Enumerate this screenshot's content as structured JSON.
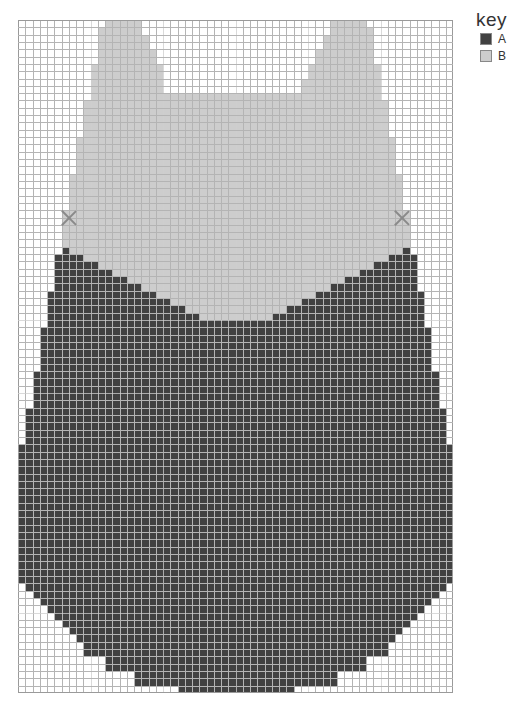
{
  "legend": {
    "title": "key",
    "items": [
      {
        "label": "A",
        "color": "#414141"
      },
      {
        "label": "B",
        "color": "#cdcdcd"
      }
    ]
  },
  "grid": {
    "cols": 60,
    "rows": 92,
    "major_every": 10,
    "major_cols": [
      10,
      20,
      30,
      40,
      50
    ],
    "major_rows": [
      41,
      51,
      61,
      71,
      81
    ],
    "line_color": "#b4b4b4",
    "background": "#ffffff"
  },
  "marks": [
    {
      "name": "left-marker",
      "col": 7,
      "row": 27
    },
    {
      "name": "right-marker",
      "col": 53,
      "row": 27
    }
  ],
  "pattern": {
    "B": [
      {
        "rows": [
          0,
          0
        ],
        "spans": [
          [
            12,
            16
          ],
          [
            43,
            47
          ]
        ]
      },
      {
        "rows": [
          1,
          1
        ],
        "spans": [
          [
            11,
            16
          ],
          [
            43,
            48
          ]
        ]
      },
      {
        "rows": [
          2,
          3
        ],
        "spans": [
          [
            11,
            17
          ],
          [
            42,
            48
          ]
        ]
      },
      {
        "rows": [
          4,
          5
        ],
        "spans": [
          [
            11,
            18
          ],
          [
            41,
            48
          ]
        ]
      },
      {
        "rows": [
          6,
          7
        ],
        "spans": [
          [
            10,
            19
          ],
          [
            40,
            49
          ]
        ]
      },
      {
        "rows": [
          8,
          9
        ],
        "spans": [
          [
            10,
            19
          ],
          [
            39,
            49
          ]
        ]
      },
      {
        "rows": [
          10,
          10
        ],
        "spans": [
          [
            10,
            49
          ]
        ]
      },
      {
        "rows": [
          11,
          15
        ],
        "spans": [
          [
            9,
            50
          ]
        ]
      },
      {
        "rows": [
          16,
          20
        ],
        "spans": [
          [
            8,
            51
          ]
        ]
      },
      {
        "rows": [
          21,
          25
        ],
        "spans": [
          [
            7,
            52
          ]
        ]
      },
      {
        "rows": [
          26,
          30
        ],
        "spans": [
          [
            6,
            53
          ]
        ]
      },
      {
        "rows": [
          31,
          31
        ],
        "spans": [
          [
            7,
            52
          ]
        ]
      },
      {
        "rows": [
          32,
          32
        ],
        "spans": [
          [
            9,
            50
          ]
        ]
      },
      {
        "rows": [
          33,
          33
        ],
        "spans": [
          [
            11,
            48
          ]
        ]
      },
      {
        "rows": [
          34,
          34
        ],
        "spans": [
          [
            13,
            46
          ]
        ]
      },
      {
        "rows": [
          35,
          35
        ],
        "spans": [
          [
            15,
            44
          ]
        ]
      },
      {
        "rows": [
          36,
          36
        ],
        "spans": [
          [
            17,
            42
          ]
        ]
      },
      {
        "rows": [
          37,
          37
        ],
        "spans": [
          [
            19,
            40
          ]
        ]
      },
      {
        "rows": [
          38,
          38
        ],
        "spans": [
          [
            21,
            38
          ]
        ]
      },
      {
        "rows": [
          39,
          39
        ],
        "spans": [
          [
            23,
            36
          ]
        ]
      },
      {
        "rows": [
          40,
          40
        ],
        "spans": [
          [
            25,
            34
          ]
        ]
      }
    ],
    "A": [
      {
        "rows": [
          31,
          31
        ],
        "spans": [
          [
            6,
            6
          ],
          [
            53,
            53
          ]
        ]
      },
      {
        "rows": [
          32,
          32
        ],
        "spans": [
          [
            5,
            8
          ],
          [
            51,
            54
          ]
        ]
      },
      {
        "rows": [
          33,
          33
        ],
        "spans": [
          [
            5,
            10
          ],
          [
            49,
            54
          ]
        ]
      },
      {
        "rows": [
          34,
          34
        ],
        "spans": [
          [
            5,
            12
          ],
          [
            47,
            54
          ]
        ]
      },
      {
        "rows": [
          35,
          35
        ],
        "spans": [
          [
            5,
            14
          ],
          [
            45,
            54
          ]
        ]
      },
      {
        "rows": [
          36,
          36
        ],
        "spans": [
          [
            5,
            16
          ],
          [
            43,
            54
          ]
        ]
      },
      {
        "rows": [
          37,
          37
        ],
        "spans": [
          [
            4,
            18
          ],
          [
            41,
            55
          ]
        ]
      },
      {
        "rows": [
          38,
          38
        ],
        "spans": [
          [
            4,
            20
          ],
          [
            39,
            55
          ]
        ]
      },
      {
        "rows": [
          39,
          39
        ],
        "spans": [
          [
            4,
            22
          ],
          [
            37,
            55
          ]
        ]
      },
      {
        "rows": [
          40,
          40
        ],
        "spans": [
          [
            4,
            24
          ],
          [
            35,
            55
          ]
        ]
      },
      {
        "rows": [
          41,
          41
        ],
        "spans": [
          [
            4,
            55
          ]
        ]
      },
      {
        "rows": [
          42,
          47
        ],
        "spans": [
          [
            3,
            56
          ]
        ]
      },
      {
        "rows": [
          48,
          52
        ],
        "spans": [
          [
            2,
            57
          ]
        ]
      },
      {
        "rows": [
          53,
          57
        ],
        "spans": [
          [
            1,
            58
          ]
        ]
      },
      {
        "rows": [
          58,
          76
        ],
        "spans": [
          [
            0,
            59
          ]
        ]
      },
      {
        "rows": [
          77,
          77
        ],
        "spans": [
          [
            1,
            58
          ]
        ]
      },
      {
        "rows": [
          78,
          78
        ],
        "spans": [
          [
            2,
            57
          ]
        ]
      },
      {
        "rows": [
          79,
          79
        ],
        "spans": [
          [
            3,
            56
          ]
        ]
      },
      {
        "rows": [
          80,
          80
        ],
        "spans": [
          [
            4,
            55
          ]
        ]
      },
      {
        "rows": [
          81,
          81
        ],
        "spans": [
          [
            5,
            54
          ]
        ]
      },
      {
        "rows": [
          82,
          82
        ],
        "spans": [
          [
            6,
            53
          ]
        ]
      },
      {
        "rows": [
          83,
          83
        ],
        "spans": [
          [
            7,
            52
          ]
        ]
      },
      {
        "rows": [
          84,
          84
        ],
        "spans": [
          [
            8,
            51
          ]
        ]
      },
      {
        "rows": [
          85,
          86
        ],
        "spans": [
          [
            9,
            50
          ]
        ]
      },
      {
        "rows": [
          87,
          88
        ],
        "spans": [
          [
            12,
            47
          ]
        ]
      },
      {
        "rows": [
          89,
          90
        ],
        "spans": [
          [
            16,
            43
          ]
        ]
      },
      {
        "rows": [
          91,
          91
        ],
        "spans": [
          [
            22,
            37
          ]
        ]
      }
    ]
  }
}
